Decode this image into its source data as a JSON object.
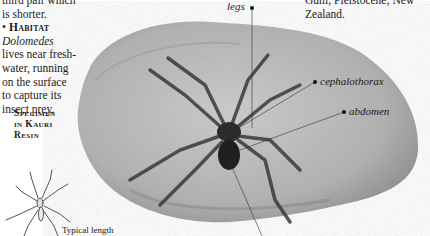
{
  "left_column": {
    "line_partial": "third pair which is shorter.",
    "habitat_bullet": "•",
    "habitat_heading": "Habitat",
    "habitat_genus": "Dolomedes",
    "habitat_lines": [
      "lives near fresh-",
      "water, running",
      "on the surface",
      "to capture its",
      "insect prey."
    ]
  },
  "specimen_heading": [
    "Specimen",
    "in Kauri",
    "Resin"
  ],
  "right_column": {
    "lines": [
      "Gum; Pleistocene; New",
      "Zealand."
    ]
  },
  "callouts": {
    "legs": "legs",
    "cephalothorax": "cephalothorax",
    "abdomen": "abdomen"
  },
  "scale_note": "Typical length",
  "colors": {
    "resin_light": "#c9c9c9",
    "resin_dark": "#8e8e8e",
    "spider": "#2b2b2b",
    "leader": "#333333"
  }
}
